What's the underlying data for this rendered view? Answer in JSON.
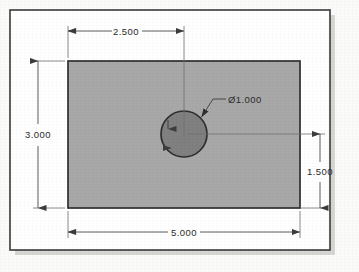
{
  "drawing": {
    "title": "Rectangular plate with centered-offset through hole",
    "colors": {
      "paper": "#fbfbfa",
      "frame_line": "#3a3a3a",
      "plate_fill": "#a8a8a8",
      "plate_outline": "#303030",
      "hole_fill": "#808080",
      "hole_outline": "#2e2e2e",
      "dimension_line": "#4a4a4a",
      "extension_line": "#6f6f6f",
      "text": "#2b2b2b",
      "shadow": "#d6d6d2"
    },
    "geometry": {
      "frame": {
        "x": 10,
        "y": 10,
        "width": 320,
        "height": 240
      },
      "plate": {
        "x": 68,
        "y": 61,
        "width": 232,
        "height": 147
      },
      "hole": {
        "cx": 184,
        "cy": 134,
        "r": 23
      }
    },
    "dimensions": [
      {
        "id": "hole-x-offset",
        "name": "horizontal-hole-location",
        "value": "2.500",
        "placement": "top",
        "text_x": 126,
        "text_y": 35,
        "line_y": 31,
        "from_x": 68,
        "to_x": 184
      },
      {
        "id": "plate-height",
        "name": "plate-overall-height",
        "value": "3.000",
        "placement": "left",
        "text_x": 38,
        "text_y": 137,
        "line_x": 38,
        "from_y": 61,
        "to_y": 208
      },
      {
        "id": "hole-diameter",
        "name": "hole-diameter-callout",
        "value": "Ø1.000",
        "placement": "leader",
        "text_x": 228,
        "text_y": 103,
        "leader": {
          "tip_x": 200,
          "tip_y": 118,
          "elbow_x": 213,
          "elbow_y": 99,
          "shoulder_x": 226,
          "shoulder_y": 99
        }
      },
      {
        "id": "hole-y-offset",
        "name": "vertical-hole-location",
        "value": "1.500",
        "placement": "right",
        "text_x": 320,
        "text_y": 173,
        "line_x": 320,
        "from_y": 134,
        "to_y": 208
      },
      {
        "id": "plate-width",
        "name": "plate-overall-width",
        "value": "5.000",
        "placement": "bottom",
        "text_x": 184,
        "text_y": 236,
        "line_y": 232,
        "from_x": 68,
        "to_x": 300
      }
    ]
  }
}
